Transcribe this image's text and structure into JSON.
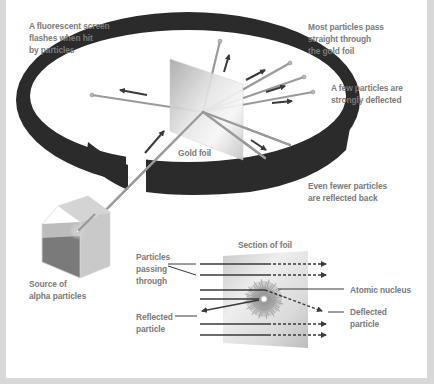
{
  "diagram": {
    "labels": {
      "screen": [
        "A fluorescent screen",
        "flashes when hit",
        "by particles"
      ],
      "most_pass": [
        "Most particles pass",
        "straight through",
        "the gold foil"
      ],
      "few_deflected": [
        "A few particles are",
        "strongly deflected"
      ],
      "fewer_reflected": [
        "Even fewer particles",
        "are reflected back"
      ],
      "gold_foil": "Gold foil",
      "source": [
        "Source of",
        "alpha particles"
      ],
      "section_title": "Section of foil",
      "passing_through": [
        "Particles",
        "passing",
        "through"
      ],
      "atomic_nucleus": "Atomic nucleus",
      "deflected_particle": [
        "Deflected",
        "particle"
      ],
      "reflected_particle": [
        "Reflected",
        "particle"
      ]
    },
    "colors": {
      "background": "#d8d8d8",
      "panel": "#ffffff",
      "ring": "#2b2b2b",
      "beam": "#9a9a9a",
      "arrow": "#3a3a3a",
      "label_text": "#7a7a7a",
      "foil_light": "#f2f2f2",
      "foil_dark": "#b5b5b5"
    }
  }
}
